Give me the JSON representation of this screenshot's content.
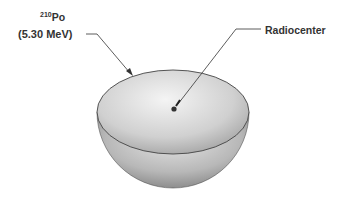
{
  "diagram": {
    "source_label": {
      "mass_number": "210",
      "element": "Po",
      "energy": "(5.30 MeV)"
    },
    "center_label": "Radiocenter",
    "shape": "hemisphere",
    "colors": {
      "line": "#333333",
      "surface_light": "#f2f2f2",
      "surface_dark": "#8a8a8a"
    }
  }
}
